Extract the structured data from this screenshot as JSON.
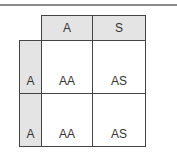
{
  "punnett_square": {
    "column_headers": [
      "A",
      "S"
    ],
    "row_headers": [
      "A",
      "A"
    ],
    "cells": [
      [
        "AA",
        "AS"
      ],
      [
        "AA",
        "AS"
      ]
    ]
  },
  "colors": {
    "header_fill": "#e4e4e4",
    "border": "#444444",
    "rule": "#8a8a8a"
  }
}
